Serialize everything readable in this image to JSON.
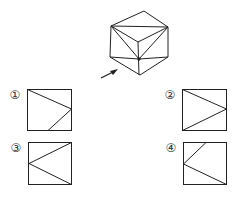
{
  "figure": {
    "arrow_direction": "viewing direction toward the front-left face",
    "stroke_color": "#222222"
  },
  "options": [
    {
      "label": "①",
      "id": "1"
    },
    {
      "label": "②",
      "id": "2"
    },
    {
      "label": "③",
      "id": "3"
    },
    {
      "label": "④",
      "id": "4"
    }
  ]
}
